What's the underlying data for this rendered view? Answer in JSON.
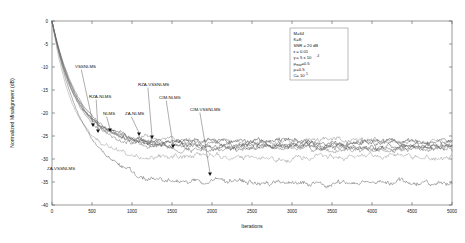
{
  "chart_data": {
    "type": "line",
    "title": "",
    "xlabel": "Iterations",
    "ylabel": "Normalized Misalignment (dB)",
    "xlim": [
      0,
      5000
    ],
    "ylim": [
      -40,
      0
    ],
    "xticks": [
      0,
      500,
      1000,
      1500,
      2000,
      2500,
      3000,
      3500,
      4000,
      4500,
      5000
    ],
    "yticks": [
      0,
      -5,
      -10,
      -15,
      -20,
      -25,
      -30,
      -35,
      -40
    ],
    "grid": false,
    "legend_position": "inline-annotations",
    "series": [
      {
        "name": "NLMS",
        "color": "#444444",
        "steady_state_db": -26.3,
        "converge_iter": 700
      },
      {
        "name": "ZA-NLMS",
        "color": "#555555",
        "steady_state_db": -26.8,
        "converge_iter": 760
      },
      {
        "name": "RZA-NLMS",
        "color": "#666666",
        "steady_state_db": -27.4,
        "converge_iter": 720
      },
      {
        "name": "CIM-NLMS",
        "color": "#777777",
        "steady_state_db": -27.9,
        "converge_iter": 800
      },
      {
        "name": "VSSNLMS",
        "color": "#999999",
        "steady_state_db": -29.6,
        "converge_iter": 640
      },
      {
        "name": "RZA-VSSNLMS",
        "color": "#888888",
        "steady_state_db": -26.1,
        "converge_iter": 690
      },
      {
        "name": "CIM-VSSNLMS",
        "color": "#5a5a5a",
        "steady_state_db": -27.2,
        "converge_iter": 820
      },
      {
        "name": "ZA-VSSNLMS",
        "color": "#606060",
        "steady_state_db": -35.2,
        "converge_iter": 900
      }
    ]
  },
  "annotations": [
    {
      "label": "VSSNLMS",
      "lx": 75,
      "ly": 68,
      "tx": 93,
      "ty": 127
    },
    {
      "label": "RZA-NLMS",
      "lx": 89,
      "ly": 98,
      "tx": 98,
      "ty": 133
    },
    {
      "label": "NLMS",
      "lx": 103,
      "ly": 115,
      "tx": 110,
      "ty": 132
    },
    {
      "label": "ZA-NLMS",
      "lx": 125,
      "ly": 115,
      "tx": 139,
      "ty": 136
    },
    {
      "label": "RZA-VSSNLMS",
      "lx": 138,
      "ly": 86,
      "tx": 152,
      "ty": 139
    },
    {
      "label": "CIM-NLMS",
      "lx": 159,
      "ly": 99,
      "tx": 173,
      "ty": 148
    },
    {
      "label": "CIM-VSSNLMS",
      "lx": 190,
      "ly": 111,
      "tx": 210,
      "ty": 176
    },
    {
      "label": "ZA-VSSNLMS",
      "lx": 47,
      "ly": 170,
      "tx": 47,
      "ty": 170,
      "no_leader": true
    }
  ],
  "parameters": {
    "lines": [
      {
        "text": "M=64"
      },
      {
        "text": "K=8;"
      },
      {
        "text": "SNR = 20 dB"
      },
      {
        "text": "= 0.01",
        "prefix": "ε"
      },
      {
        "text": " = 5 x 10",
        "prefix": "γ",
        "sup": "-4"
      },
      {
        "text": "=0.5",
        "prefix": "μ",
        "sub": "max"
      },
      {
        "text": "=0.5",
        "prefix": "ρ"
      },
      {
        "text": "= 10",
        "prefix": "C",
        "sup": "-5"
      }
    ]
  }
}
